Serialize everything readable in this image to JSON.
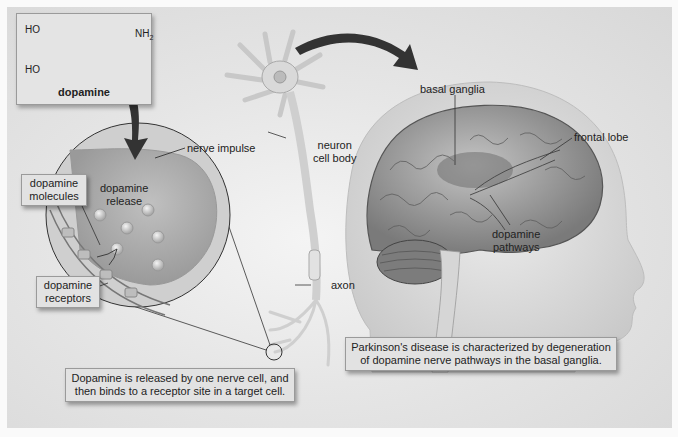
{
  "molecule": {
    "name": "dopamine",
    "groups": {
      "oh_top": "HO",
      "oh_bottom": "HO",
      "amine": "NH",
      "amine_sub": "2"
    }
  },
  "synapse_labels": {
    "nerve_impulse": "nerve impulse",
    "dopamine_release_line1": "dopamine",
    "dopamine_release_line2": "release",
    "dopamine_molecules_line1": "dopamine",
    "dopamine_molecules_line2": "molecules",
    "dopamine_receptors_line1": "dopamine",
    "dopamine_receptors_line2": "receptors"
  },
  "neuron_labels": {
    "cell_body_line1": "neuron",
    "cell_body_line2": "cell body",
    "axon": "axon"
  },
  "brain_labels": {
    "basal_ganglia": "basal ganglia",
    "frontal_lobe": "frontal lobe",
    "pathways_line1": "dopamine",
    "pathways_line2": "pathways"
  },
  "captions": {
    "release_line1": "Dopamine is released by one nerve cell, and",
    "release_line2": "then binds to a receptor site in a target cell.",
    "parkinsons_line1": "Parkinson's disease is characterized by degeneration",
    "parkinsons_line2": "of dopamine nerve pathways in the basal ganglia."
  },
  "colors": {
    "panel": "#e0e0e0",
    "box": "#e2e2e2",
    "arrow": "#3a3a3a",
    "brain": "#9a9a9a",
    "head": "#d2d2d2"
  }
}
